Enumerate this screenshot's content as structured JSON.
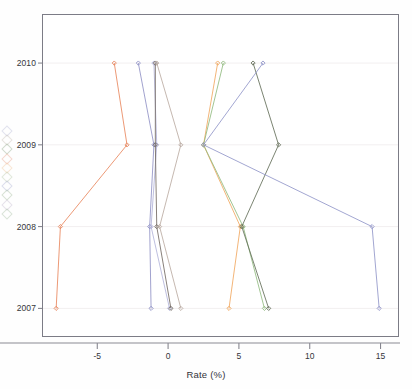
{
  "chart_data": {
    "type": "line",
    "title": "",
    "subtitle": "",
    "xlabel": "Rate (%)",
    "ylabel": "",
    "orientation": "horizontal-time",
    "grid": true,
    "legend_position": "left-cropped",
    "xlim": [
      -8.9,
      16.3
    ],
    "ylim": [
      2006.65,
      2010.6
    ],
    "xticks": [
      -5,
      0,
      5,
      10,
      15
    ],
    "xticklabels": [
      "-5",
      "0",
      "5",
      "10",
      "15"
    ],
    "yticks": [
      2007,
      2008,
      2009,
      2010
    ],
    "yticklabels": [
      "2007",
      "2008",
      "2009",
      "2010"
    ],
    "x": [
      2007,
      2008,
      2009,
      2010
    ],
    "series": [
      {
        "name": "series-1",
        "color": "#e8845a",
        "values": [
          -7.9,
          -7.6,
          -2.9,
          -3.8
        ]
      },
      {
        "name": "series-2",
        "color": "#8d8fc4",
        "values": [
          -1.2,
          -1.3,
          -1.0,
          -2.1
        ]
      },
      {
        "name": "series-3",
        "color": "#b0b2d8",
        "values": [
          0.1,
          -1.2,
          -0.8,
          -1.0
        ]
      },
      {
        "name": "series-4",
        "color": "#6f665e",
        "values": [
          0.2,
          -0.8,
          -0.9,
          -0.9
        ]
      },
      {
        "name": "series-5",
        "color": "#b9a9a0",
        "values": [
          0.9,
          -0.6,
          0.9,
          -0.8
        ]
      },
      {
        "name": "series-6",
        "color": "#f0a65c",
        "values": [
          4.3,
          5.1,
          2.5,
          3.5
        ]
      },
      {
        "name": "series-7",
        "color": "#8fb97c",
        "values": [
          6.8,
          5.3,
          2.5,
          3.9
        ]
      },
      {
        "name": "series-8",
        "color": "#5f6a55",
        "values": [
          7.1,
          5.2,
          7.8,
          6.0
        ]
      },
      {
        "name": "series-9",
        "color": "#8f93c8",
        "values": [
          14.9,
          14.4,
          2.5,
          6.7
        ]
      }
    ],
    "legend_swatches": [
      {
        "color": "#b6b8d6"
      },
      {
        "color": "#c5bdb5"
      },
      {
        "color": "#8fa886"
      },
      {
        "color": "#e8a089"
      },
      {
        "color": "#f0c69a"
      },
      {
        "color": "#b6c7a8"
      },
      {
        "color": "#a9b0d2"
      },
      {
        "color": "#9fb899"
      },
      {
        "color": "#c2b8cf"
      },
      {
        "color": "#a6bfa0"
      }
    ]
  }
}
